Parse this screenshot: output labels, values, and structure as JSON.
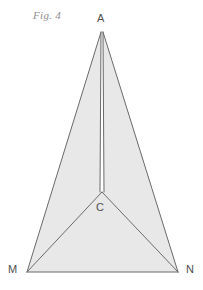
{
  "figure": {
    "caption": "Fig. 4",
    "background_color": "#ffffff",
    "fill_color": "#e8e8e8",
    "stroke_color": "#6a6a6a",
    "label_color": "#4e4e4e",
    "caption_color": "#8d8d8d",
    "stroke_width": 1
  },
  "labels": {
    "apex": "A",
    "center": "C",
    "bottom_left": "M",
    "bottom_right": "N"
  },
  "geometry": {
    "points": {
      "A": [
        102,
        32
      ],
      "C": [
        102,
        192
      ],
      "M": [
        27,
        272
      ],
      "N": [
        178,
        272
      ]
    },
    "slit": {
      "top": [
        102,
        32
      ],
      "left_x_at_c": 100,
      "right_x_at_c": 104,
      "bottom_y": 192
    },
    "regions": [
      {
        "name": "left-face",
        "path": "M 101,32 L 27,272 L 102,192 L 100,192 Z"
      },
      {
        "name": "right-face",
        "path": "M 103,32 L 104,192 L 102,192 L 178,272 Z"
      },
      {
        "name": "base-face",
        "path": "M 27,272 L 102,192 L 178,272 Z"
      }
    ],
    "edges": [
      {
        "name": "edge-A-M",
        "from": [
          101,
          32
        ],
        "to": [
          27,
          272
        ]
      },
      {
        "name": "edge-A-N",
        "from": [
          103,
          32
        ],
        "to": [
          178,
          272
        ]
      },
      {
        "name": "edge-M-N",
        "from": [
          27,
          272
        ],
        "to": [
          178,
          272
        ]
      },
      {
        "name": "edge-C-M",
        "from": [
          102,
          192
        ],
        "to": [
          27,
          272
        ]
      },
      {
        "name": "edge-C-N",
        "from": [
          102,
          192
        ],
        "to": [
          178,
          272
        ]
      },
      {
        "name": "slit-left",
        "from": [
          101,
          32
        ],
        "to": [
          100,
          192
        ]
      },
      {
        "name": "slit-right",
        "from": [
          103,
          32
        ],
        "to": [
          104,
          192
        ]
      }
    ]
  }
}
